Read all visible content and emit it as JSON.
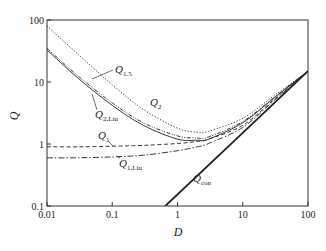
{
  "chart_data": {
    "type": "line",
    "title": "",
    "xlabel": "D",
    "ylabel": "Q",
    "xscale": "log",
    "yscale": "log",
    "xlim": [
      0.01,
      100
    ],
    "ylim": [
      0.1,
      100
    ],
    "xticks": [
      "0.01",
      "0.1",
      "1",
      "10",
      "100"
    ],
    "yticks": [
      "0.1",
      "1",
      "10",
      "100"
    ],
    "grid": false,
    "legend": "inline labels",
    "series": [
      {
        "name": "Q_1.5",
        "label_main": "Q",
        "label_sub": "1.5",
        "style": "dotted",
        "x": [
          0.01,
          0.03,
          0.1,
          0.3,
          1,
          2,
          3,
          10,
          30,
          100
        ],
        "y": [
          80,
          28,
          9.0,
          3.6,
          1.8,
          1.55,
          1.6,
          2.6,
          6.0,
          15
        ]
      },
      {
        "name": "Q_2",
        "label_main": "Q",
        "label_sub": "2",
        "style": "dash-dot-dot",
        "x": [
          0.01,
          0.03,
          0.1,
          0.3,
          1,
          2,
          3,
          10,
          30,
          100
        ],
        "y": [
          35,
          12.5,
          4.6,
          2.2,
          1.35,
          1.25,
          1.3,
          2.3,
          5.6,
          15
        ]
      },
      {
        "name": "Q_2,Liu",
        "label_main": "Q",
        "label_sub": "2,Liu",
        "style": "solid",
        "x": [
          0.01,
          0.03,
          0.1,
          0.3,
          1,
          2,
          3,
          10,
          30,
          100
        ],
        "y": [
          33,
          11.5,
          4.2,
          2.0,
          1.2,
          1.15,
          1.2,
          2.2,
          5.5,
          15
        ]
      },
      {
        "name": "Q_1",
        "label_main": "Q",
        "label_sub": "1",
        "style": "dashed",
        "x": [
          0.01,
          0.03,
          0.1,
          0.3,
          1,
          2,
          3,
          10,
          30,
          100
        ],
        "y": [
          0.9,
          0.9,
          0.92,
          0.95,
          1.02,
          1.1,
          1.2,
          2.0,
          5.2,
          15
        ]
      },
      {
        "name": "Q_1,Liu",
        "label_main": "Q",
        "label_sub": "1,Liu",
        "style": "dash-dot",
        "x": [
          0.01,
          0.03,
          0.1,
          0.3,
          1,
          2,
          3,
          10,
          30,
          100
        ],
        "y": [
          0.6,
          0.6,
          0.62,
          0.66,
          0.78,
          0.9,
          1.02,
          1.85,
          5.0,
          15
        ]
      },
      {
        "name": "Q_con",
        "label_main": "Q",
        "label_sub": "con",
        "style": "solid-thick",
        "x": [
          0.65,
          100
        ],
        "y": [
          0.1,
          15
        ]
      }
    ]
  },
  "labels": {
    "x_axis": "D",
    "y_axis": "Q"
  }
}
